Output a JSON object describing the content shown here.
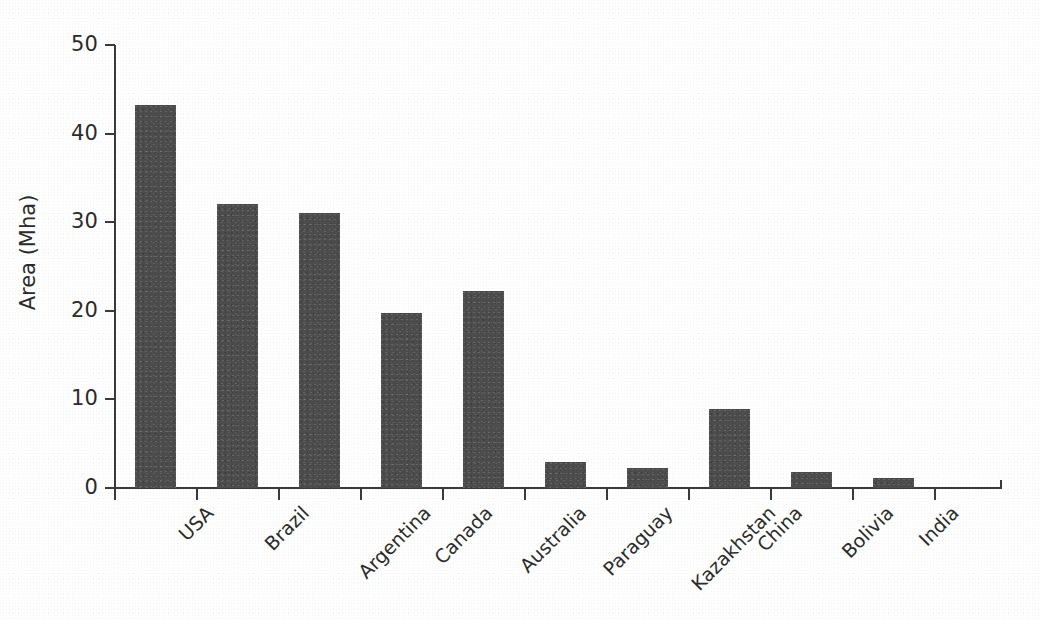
{
  "chart_data": {
    "type": "bar",
    "title": "",
    "subtitle": "",
    "xlabel": "",
    "ylabel": "Area (Mha)",
    "ylim": [
      0,
      50
    ],
    "yticks": [
      0,
      10,
      20,
      30,
      40,
      50
    ],
    "ytick_labels": [
      "0",
      "10",
      "20",
      "30",
      "40",
      "50"
    ],
    "grid": false,
    "legend": null,
    "bar_color": "#4d4d4d",
    "axis_color": "#3a3a3a",
    "text_color": "#2b2b2b",
    "background_color": "#ffffff",
    "xtick_label_rotation": -45,
    "categories": [
      "USA",
      "Brazil",
      "Argentina",
      "Canada",
      "Australia",
      "Paraguay",
      "Kazakhstan",
      "China",
      "Bolivia",
      "India"
    ],
    "values": [
      43.2,
      32.0,
      31.0,
      19.8,
      22.2,
      2.9,
      2.3,
      8.9,
      1.8,
      1.1
    ],
    "bars": [
      {
        "category": "USA",
        "value": 43.2
      },
      {
        "category": "Brazil",
        "value": 32.0
      },
      {
        "category": "Argentina",
        "value": 31.0
      },
      {
        "category": "Canada",
        "value": 19.8
      },
      {
        "category": "Australia",
        "value": 22.2
      },
      {
        "category": "Paraguay",
        "value": 2.9
      },
      {
        "category": "Kazakhstan",
        "value": 2.3
      },
      {
        "category": "China",
        "value": 8.9
      },
      {
        "category": "Bolivia",
        "value": 1.8
      },
      {
        "category": "India",
        "value": 1.1
      }
    ]
  }
}
